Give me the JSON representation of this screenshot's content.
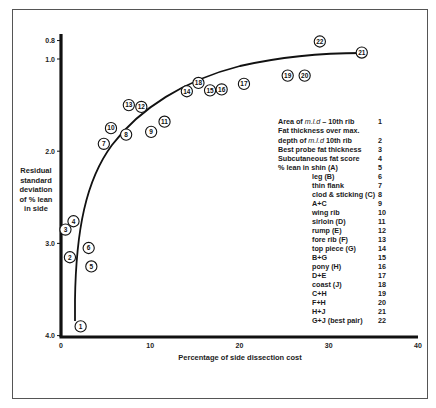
{
  "chart_data": {
    "type": "scatter",
    "title": "",
    "xlabel": "Percentage of side dissection cost",
    "ylabel": "Residual standard deviation of % lean in side",
    "ylabel_lines": [
      "Residual",
      "standard",
      "deviation",
      "of % lean",
      "in side"
    ],
    "xlim": [
      0,
      40
    ],
    "ylim": [
      4.0,
      0.8
    ],
    "y_inverted": true,
    "x_ticks": [
      0,
      10,
      20,
      30,
      40
    ],
    "x_tick_labels": [
      "0",
      "10",
      "20",
      "30",
      "40"
    ],
    "y_ticks": [
      0.8,
      1.0,
      2.0,
      3.0,
      4.0
    ],
    "y_tick_labels": [
      "0.8",
      "1.0",
      "2.0",
      "3.0",
      "4.0"
    ],
    "grid": false,
    "legend_position": "right-inside",
    "curve": "hand-drawn efficiency frontier rising steeply from point 1 and flattening to point 21",
    "points": [
      {
        "id": 1,
        "x": 2.2,
        "y": 3.9
      },
      {
        "id": 2,
        "x": 1.0,
        "y": 3.15
      },
      {
        "id": 3,
        "x": 0.5,
        "y": 2.85
      },
      {
        "id": 4,
        "x": 1.4,
        "y": 2.76
      },
      {
        "id": 5,
        "x": 3.4,
        "y": 3.25
      },
      {
        "id": 6,
        "x": 3.1,
        "y": 3.05
      },
      {
        "id": 7,
        "x": 4.8,
        "y": 1.92
      },
      {
        "id": 8,
        "x": 7.3,
        "y": 1.82
      },
      {
        "id": 9,
        "x": 10.1,
        "y": 1.79
      },
      {
        "id": 10,
        "x": 5.6,
        "y": 1.75
      },
      {
        "id": 11,
        "x": 11.6,
        "y": 1.68
      },
      {
        "id": 12,
        "x": 9.0,
        "y": 1.52
      },
      {
        "id": 13,
        "x": 7.6,
        "y": 1.5
      },
      {
        "id": 14,
        "x": 14.1,
        "y": 1.35
      },
      {
        "id": 15,
        "x": 16.7,
        "y": 1.34
      },
      {
        "id": 16,
        "x": 18.0,
        "y": 1.33
      },
      {
        "id": 17,
        "x": 20.5,
        "y": 1.27
      },
      {
        "id": 18,
        "x": 15.4,
        "y": 1.26
      },
      {
        "id": 19,
        "x": 25.4,
        "y": 1.18
      },
      {
        "id": 20,
        "x": 27.3,
        "y": 1.18
      },
      {
        "id": 21,
        "x": 33.7,
        "y": 0.93
      },
      {
        "id": 22,
        "x": 29.0,
        "y": 0.81
      }
    ]
  },
  "legend": {
    "items": [
      {
        "text": "Area of m.l.d – 10th rib",
        "num": "1"
      },
      {
        "text": "Fat thickness over max.",
        "num": ""
      },
      {
        "text": "  depth of m.l.d  10th rib",
        "num": "2"
      },
      {
        "text": "Best probe fat thickness",
        "num": "3"
      },
      {
        "text": "Subcutaneous fat score",
        "num": "4"
      },
      {
        "text": "% lean in  shin (A)",
        "num": "5"
      },
      {
        "text": "leg (B)",
        "num": "6"
      },
      {
        "text": "thin flank",
        "num": "7"
      },
      {
        "text": "clod & sticking (C)",
        "num": "8"
      },
      {
        "text": "A+C",
        "num": "9"
      },
      {
        "text": "wing rib",
        "num": "10"
      },
      {
        "text": "sirloin (D)",
        "num": "11"
      },
      {
        "text": "rump (E)",
        "num": "12"
      },
      {
        "text": "fore  rib (F)",
        "num": "13"
      },
      {
        "text": "top piece (G)",
        "num": "14"
      },
      {
        "text": "B+G",
        "num": "15"
      },
      {
        "text": "pony (H)",
        "num": "16"
      },
      {
        "text": "D+E",
        "num": "17"
      },
      {
        "text": "coast (J)",
        "num": "18"
      },
      {
        "text": "C+H",
        "num": "19"
      },
      {
        "text": "F+H",
        "num": "20"
      },
      {
        "text": "H+J",
        "num": "21"
      },
      {
        "text": "G+J (best  pair)",
        "num": "22"
      }
    ]
  },
  "colors": {
    "ink": "#111111",
    "frame": "#555555",
    "background": "#ffffff"
  }
}
